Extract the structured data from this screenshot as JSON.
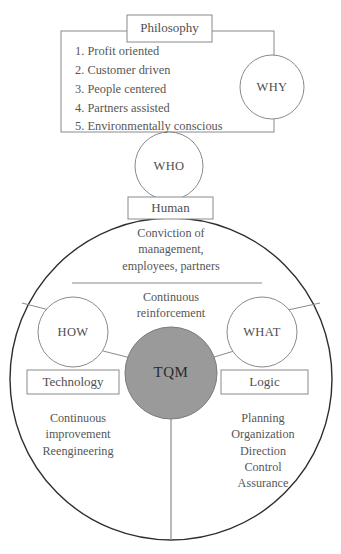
{
  "diagram": {
    "title_box": {
      "label": "Philosophy"
    },
    "philosophy_list": {
      "items": [
        "1. Profit oriented",
        "2. Customer driven",
        "3. People centered",
        "4. Partners assisted",
        "5. Environmentally conscious"
      ]
    },
    "circles": {
      "why": "WHY",
      "who": "WHO",
      "how": "HOW",
      "what": "WHAT",
      "tqm": "TQM"
    },
    "boxes": {
      "human": "Human",
      "technology": "Technology",
      "logic": "Logic"
    },
    "texts": {
      "conviction": "Conviction of\nmanagement,\nemployees, partners",
      "reinforcement": "Continuous\nreinforcement",
      "left_outcomes": "Continuous\nimprovement\nReengineering",
      "right_outcomes": "Planning\nOrganization\nDirection\nControl\nAssurance"
    },
    "colors": {
      "stroke": "#8a8a8a",
      "outer_stroke": "#2e2e2e",
      "tqm_fill": "#9a9a9a",
      "text": "#575757",
      "background": "#ffffff"
    }
  }
}
